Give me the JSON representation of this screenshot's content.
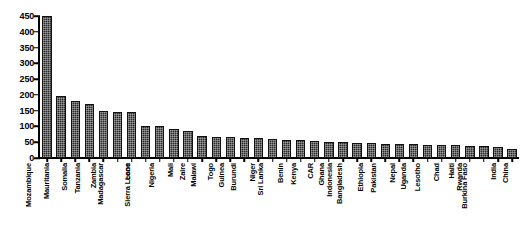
{
  "chart_data": {
    "type": "bar",
    "title": "",
    "subtitle": "",
    "xlabel": "",
    "ylabel": "",
    "ylim": [
      0,
      450
    ],
    "ytick_step": 50,
    "yticks": [
      0,
      50,
      100,
      150,
      200,
      250,
      300,
      350,
      400,
      450
    ],
    "ytick_labels": [
      "0",
      "50",
      "100",
      "150",
      "200",
      "250",
      "300",
      "350",
      "400",
      "450"
    ],
    "grid": false,
    "legend": null,
    "bar_color": "#2b2b2b",
    "bar_fill_pattern": "dotted-hatch",
    "label_rotation": 90,
    "categories": [
      "Mozambique",
      "Mauritania",
      "Somalia",
      "Tanzania",
      "Zambia",
      "Madagascar",
      "Laos",
      "Sierra Leone",
      "Nigeria",
      "Mali",
      "Zaire",
      "Malawi",
      "Togo",
      "Guinea",
      "Burundi",
      "Niger",
      "Sri Lanka",
      "Benin",
      "Kenya",
      "CAR",
      "Ghana",
      "Indonesia",
      "Bangladesh",
      "Ethiopia",
      "Pakistan",
      "Nepal",
      "Uganda",
      "Lesotho",
      "Chad",
      "Haiti",
      "Rwanda",
      "Burkina Faso",
      "India",
      "China"
    ],
    "values": [
      450,
      198,
      180,
      170,
      150,
      147,
      147,
      100,
      100,
      92,
      85,
      70,
      68,
      66,
      64,
      62,
      60,
      58,
      56,
      54,
      52,
      50,
      48,
      47,
      45,
      44,
      43,
      42,
      41,
      40,
      38,
      37,
      35,
      27
    ]
  }
}
